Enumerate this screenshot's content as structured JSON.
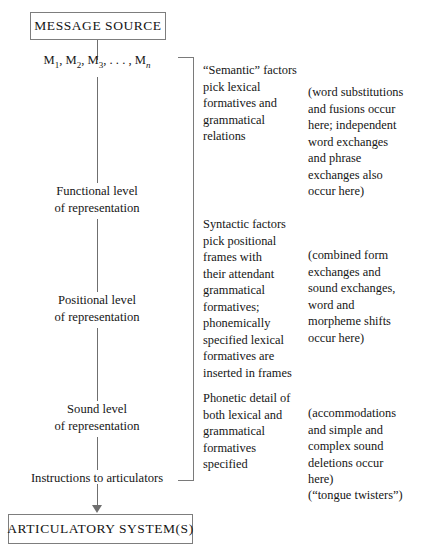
{
  "diagram": {
    "nodes": {
      "source": "MESSAGE SOURCE",
      "articulatory": "ARTICULATORY SYSTEM(S)"
    },
    "stages": {
      "messages_prefix": "M",
      "messages_full": "M1, M2, M3, . . . , Mn",
      "functional": "Functional level\nof representation",
      "positional": "Positional level\nof representation",
      "sound": "Sound level\nof representation",
      "instructions": "Instructions to articulators"
    },
    "annotations": {
      "semantic_description": "“Semantic” factors\npick lexical\nformatives and\ngrammatical\nrelations",
      "semantic_errors": "(word substitutions\nand fusions occur\nhere; independent\nword exchanges\nand phrase\nexchanges also\noccur here)",
      "syntactic_description": "Syntactic factors\npick positional\nframes with\ntheir attendant\ngrammatical\nformatives;\nphonemically\nspecified lexical\nformatives are\ninserted in frames",
      "syntactic_errors": "(combined form\nexchanges and\nsound exchanges,\nword and\nmorpheme shifts\noccur here)",
      "phonetic_description": "Phonetic detail of\nboth lexical and\ngrammatical\nformatives\nspecified",
      "phonetic_errors": "(accommodations\nand simple and\ncomplex sound\ndeletions occur\nhere)",
      "tongue_twisters": "(“tongue twisters”)"
    },
    "colors": {
      "ink": "#161616",
      "rule": "#7a7a7a",
      "background": "#ffffff"
    }
  }
}
